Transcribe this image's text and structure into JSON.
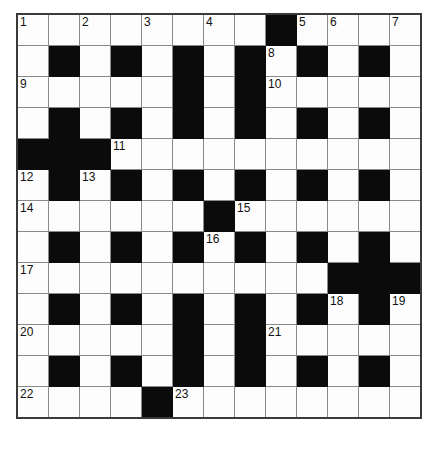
{
  "puzzle": {
    "type": "crossword-grid",
    "rows": 13,
    "columns": 13,
    "cell_size_px": 32,
    "colors": {
      "block": "#0b0b0b",
      "cell": "#fdfdfd",
      "gridline": "#8a8a8a",
      "border": "#3a3a3a",
      "number_text": "#111111",
      "page_background": "#ffffff"
    },
    "legend": {
      "white": "open letter cell",
      "black": "blocked cell"
    },
    "grid": [
      [
        "white",
        "white",
        "white",
        "white",
        "white",
        "white",
        "white",
        "white",
        "black",
        "white",
        "white",
        "white",
        "white"
      ],
      [
        "white",
        "black",
        "white",
        "black",
        "white",
        "black",
        "white",
        "black",
        "white",
        "black",
        "white",
        "black",
        "white"
      ],
      [
        "white",
        "white",
        "white",
        "white",
        "white",
        "black",
        "white",
        "black",
        "white",
        "white",
        "white",
        "white",
        "white"
      ],
      [
        "white",
        "black",
        "white",
        "black",
        "white",
        "black",
        "white",
        "black",
        "white",
        "black",
        "white",
        "black",
        "white"
      ],
      [
        "black",
        "black",
        "black",
        "white",
        "white",
        "white",
        "white",
        "white",
        "white",
        "white",
        "white",
        "white",
        "white"
      ],
      [
        "white",
        "black",
        "white",
        "black",
        "white",
        "black",
        "white",
        "black",
        "white",
        "black",
        "white",
        "black",
        "white"
      ],
      [
        "white",
        "white",
        "white",
        "white",
        "white",
        "white",
        "black",
        "white",
        "white",
        "white",
        "white",
        "white",
        "white"
      ],
      [
        "white",
        "black",
        "white",
        "black",
        "white",
        "black",
        "white",
        "black",
        "white",
        "black",
        "white",
        "black",
        "white"
      ],
      [
        "white",
        "white",
        "white",
        "white",
        "white",
        "white",
        "white",
        "white",
        "white",
        "white",
        "black",
        "black",
        "black"
      ],
      [
        "white",
        "black",
        "white",
        "black",
        "white",
        "black",
        "white",
        "black",
        "white",
        "black",
        "white",
        "black",
        "white"
      ],
      [
        "white",
        "white",
        "white",
        "white",
        "white",
        "black",
        "white",
        "black",
        "white",
        "white",
        "white",
        "white",
        "white"
      ],
      [
        "white",
        "black",
        "white",
        "black",
        "white",
        "black",
        "white",
        "black",
        "white",
        "black",
        "white",
        "black",
        "white"
      ],
      [
        "white",
        "white",
        "white",
        "white",
        "black",
        "white",
        "white",
        "white",
        "white",
        "white",
        "white",
        "white",
        "white"
      ]
    ],
    "numbers": [
      [
        "1",
        "",
        "2",
        "",
        "3",
        "",
        "4",
        "",
        "",
        "5",
        "6",
        "",
        "7"
      ],
      [
        "",
        "",
        "",
        "",
        "",
        "",
        "",
        "",
        "8",
        "",
        "",
        "",
        ""
      ],
      [
        "9",
        "",
        "",
        "",
        "",
        "",
        "",
        "",
        "10",
        "",
        "",
        "",
        ""
      ],
      [
        "",
        "",
        "",
        "",
        "",
        "",
        "",
        "",
        "",
        "",
        "",
        "",
        ""
      ],
      [
        "",
        "",
        "",
        "11",
        "",
        "",
        "",
        "",
        "",
        "",
        "",
        "",
        ""
      ],
      [
        "12",
        "",
        "13",
        "",
        "",
        "",
        "",
        "",
        "",
        "",
        "",
        "",
        ""
      ],
      [
        "14",
        "",
        "",
        "",
        "",
        "",
        "",
        "15",
        "",
        "",
        "",
        "",
        ""
      ],
      [
        "",
        "",
        "",
        "",
        "",
        "",
        "16",
        "",
        "",
        "",
        "",
        "",
        ""
      ],
      [
        "17",
        "",
        "",
        "",
        "",
        "",
        "",
        "",
        "",
        "",
        "",
        "",
        ""
      ],
      [
        "",
        "",
        "",
        "",
        "",
        "",
        "",
        "",
        "",
        "",
        "18",
        "",
        "19"
      ],
      [
        "20",
        "",
        "",
        "",
        "",
        "",
        "",
        "",
        "21",
        "",
        "",
        "",
        ""
      ],
      [
        "",
        "",
        "",
        "",
        "",
        "",
        "",
        "",
        "",
        "",
        "",
        "",
        ""
      ],
      [
        "22",
        "",
        "",
        "",
        "",
        "23",
        "",
        "",
        "",
        "",
        "",
        "",
        ""
      ]
    ],
    "clue_numbers_present": [
      "1",
      "2",
      "3",
      "4",
      "5",
      "6",
      "7",
      "8",
      "9",
      "10",
      "11",
      "12",
      "13",
      "14",
      "15",
      "16",
      "17",
      "18",
      "19",
      "20",
      "21",
      "22",
      "23"
    ],
    "total_clue_numbers": 23
  }
}
